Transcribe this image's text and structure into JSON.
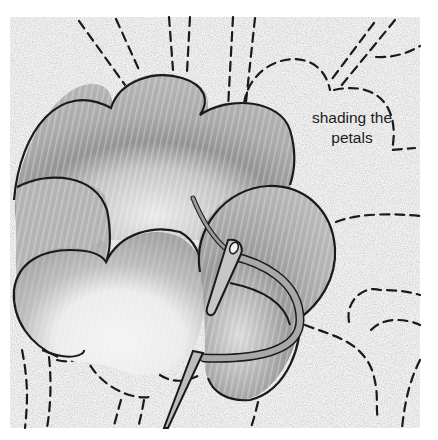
{
  "illustration": {
    "subject": "embroidery flower petals with needle and thread",
    "caption": {
      "line1": "shading the",
      "line2": "petals"
    },
    "colors": {
      "background": "#ffffff",
      "fabric": "#f1f1f1",
      "petal_light": "#c9c9c9",
      "petal_mid": "#a9a9a9",
      "petal_dark": "#8e8e8e",
      "petal_center": "#ececec",
      "outline": "#1a1a1a",
      "needle": "#b8b8b8",
      "thread": "#a8a8a8"
    },
    "elements": [
      "fabric-background",
      "top-petal",
      "left-petal",
      "bottom-left-petal",
      "right-petal",
      "needle",
      "thread",
      "stitch-guidelines",
      "caption"
    ]
  }
}
